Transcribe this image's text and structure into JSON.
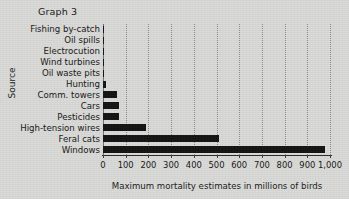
{
  "title": "Graph 3",
  "axes": {
    "ylabel": "Source",
    "xlabel": "Maximum mortality estimates in millions of birds",
    "xticklabels": [
      "0",
      "100",
      "200",
      "300",
      "400",
      "500",
      "600",
      "700",
      "800",
      "900",
      "1,000"
    ]
  },
  "colors": {
    "background": "#d9d9d7",
    "bar": "#121212",
    "grid": "#8d8d8b",
    "axis": "#2a2a2a",
    "text": "#151515"
  },
  "chart_data": {
    "type": "bar",
    "orientation": "horizontal",
    "title": "Graph 3",
    "xlabel": "Maximum mortality estimates in millions of birds",
    "ylabel": "Source",
    "xlim": [
      0,
      1000
    ],
    "xticks": [
      0,
      100,
      200,
      300,
      400,
      500,
      600,
      700,
      800,
      900,
      1000
    ],
    "grid": true,
    "legend": null,
    "units": "millions of birds",
    "categories": [
      "Fishing by-catch",
      "Oil spills",
      "Electrocution",
      "Wind turbines",
      "Oil waste pits",
      "Hunting",
      "Comm. towers",
      "Cars",
      "Pesticides",
      "High-tension wires",
      "Feral cats",
      "Windows"
    ],
    "values": [
      3,
      3,
      3,
      4,
      4,
      12,
      60,
      70,
      72,
      190,
      510,
      980
    ]
  }
}
